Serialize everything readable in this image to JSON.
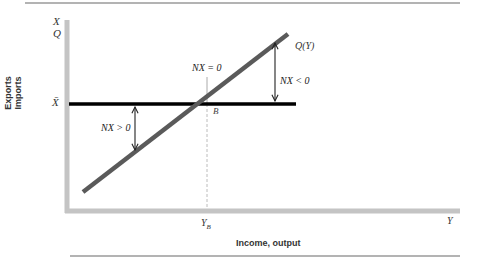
{
  "diagram": {
    "type": "economics-line-diagram",
    "y_axis": {
      "top_labels": [
        "X",
        "Q"
      ],
      "side_label_line1": "Exports",
      "side_label_line2": "Imports",
      "level_label": "X̄"
    },
    "x_axis": {
      "label": "Income, output",
      "end_label": "Y",
      "tick_label_main": "Y",
      "tick_label_sub": "B"
    },
    "curves": [
      {
        "name": "Q(Y)",
        "label": "Q(Y)",
        "kind": "upward-sloping import line",
        "color": "#5a5a5a"
      },
      {
        "name": "X-bar",
        "label": "X̄",
        "kind": "horizontal export line",
        "color": "#000000"
      }
    ],
    "point": {
      "label": "B"
    },
    "annotations": {
      "nx_zero": "NX = 0",
      "nx_negative": "NX < 0",
      "nx_positive": "NX > 0"
    },
    "colors": {
      "axis": "#c4c4c4",
      "imports_line": "#5a5a5a",
      "exports_line": "#000000",
      "guide": "#bcbcbc",
      "rule": "#9a9a9a"
    }
  }
}
